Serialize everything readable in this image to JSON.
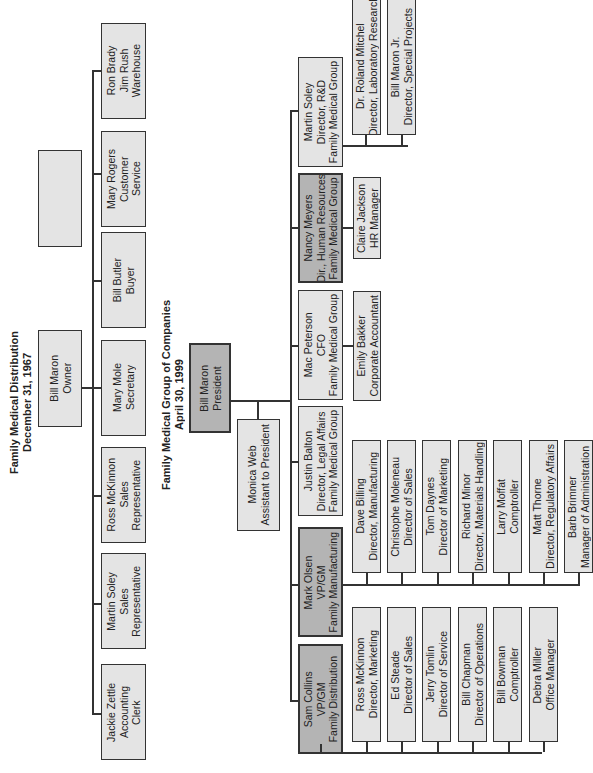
{
  "orientation": "rotated 90° counter-clockwise (text reads bottom-to-top)",
  "chart_1967": {
    "title": "Family Medical Distribution",
    "date": "December 31, 1967",
    "root": {
      "name": "Bill Maron",
      "title": "Owner"
    },
    "reports": [
      {
        "name": "Jackie Zettle",
        "title": "Accounting Clerk"
      },
      {
        "name": "Martin Soley",
        "title": "Sales Representative"
      },
      {
        "name": "Ross McKinnon",
        "title": "Sales Representative"
      },
      {
        "name": "Mary Mole",
        "title": "Secretary"
      },
      {
        "name": "Bill Butler",
        "title": "Buyer"
      },
      {
        "name": "Mary Rogers",
        "title": "Customer Service"
      },
      {
        "name": "Ron Brady / Jim Rush",
        "title": "Warehouse"
      }
    ]
  },
  "chart_1999": {
    "title": "Family Medical Group of Companies",
    "date": "April 30, 1999",
    "root": {
      "name": "Bill Maron",
      "title": "President"
    },
    "assistant": {
      "name": "Monica Web",
      "title": "Assistant to President"
    },
    "reports": [
      {
        "name": "Sam Collins",
        "title": "VP/GM",
        "org": "Family Distribution",
        "reports": [
          {
            "name": "Ross McKinnon",
            "title": "Director, Marketing"
          },
          {
            "name": "Ed Steade",
            "title": "Director of Sales"
          },
          {
            "name": "Jerry Tomlin",
            "title": "Director of Service"
          },
          {
            "name": "Bill Chapman",
            "title": "Director of Operations"
          },
          {
            "name": "Bill Bowman",
            "title": "Comptroller"
          },
          {
            "name": "Debra Miller",
            "title": "Office Manager"
          }
        ]
      },
      {
        "name": "Mark Olsen",
        "title": "VP/GM",
        "org": "Family Manufacturing",
        "reports": [
          {
            "name": "Dave Billing",
            "title": "Director, Manufacturing"
          },
          {
            "name": "Christophe Moleneau",
            "title": "Director of Sales"
          },
          {
            "name": "Tom Daynes",
            "title": "Director of Marketing"
          },
          {
            "name": "Richard Minor",
            "title": "Director, Materials Handling"
          },
          {
            "name": "Larry Moffat",
            "title": "Comptroller"
          },
          {
            "name": "Matt Thorne",
            "title": "Director, Regulatory Affairs"
          },
          {
            "name": "Barb Brimner",
            "title": "Manager of Administration"
          }
        ]
      },
      {
        "name": "Justin Balton",
        "title": "Director, Legal Affairs",
        "org": "Family Medical Group"
      },
      {
        "name": "Mac Peterson",
        "title": "CFO",
        "org": "Family Medical Group",
        "reports": [
          {
            "name": "Emily Bakker",
            "title": "Corporate Accountant"
          }
        ]
      },
      {
        "name": "Nancy Meyers",
        "title": "Dir., Human Resources",
        "org": "Family Medical Group",
        "reports": [
          {
            "name": "Claire Jackson",
            "title": "HR Manager"
          }
        ]
      },
      {
        "name": "Martin Soley",
        "title": "Director, R&D",
        "org": "Family Medical Group",
        "reports": [
          {
            "name": "Dr. Roland Mitchel",
            "title": "Director, Laboratory Research"
          },
          {
            "name": "Bill Maron Jr.",
            "title": "Director, Special Projects"
          }
        ]
      }
    ]
  },
  "labels": {
    "t1": "Family Medical Distribution\nDecember 31, 1967",
    "t2": "Family Medical Group of Companies\nApril 30, 1999",
    "owner": "Bill Maron\nOwner",
    "ron": "Ron Brady\nJim Rush\nWarehouse",
    "mrogers": "Mary Rogers\nCustomer\nService",
    "butler": "Bill Butler\nBuyer",
    "mole": "Mary Mole\nSecretary",
    "ross67": "Ross McKinnon\nSales\nRepresentative",
    "soley67": "Martin Soley\nSales\nRepresentative",
    "zettle": "Jackie Zettle\nAccounting\nClerk",
    "president": "Bill Maron\nPresident",
    "monica": "Monica Web\nAssistant to President",
    "soleyrd": "Martin Soley\nDirector, R&D\nFamily Medical Group",
    "nancy": "Nancy Meyers\nDir., Human Resources\nFamily Medical Group",
    "mac": "Mac Peterson\nCFO\nFamily Medical Group",
    "justin": "Justin Balton\nDirector, Legal Affairs\nFamily Medical Group",
    "mark": "Mark Olsen\nVP/GM\nFamily Manufacturing",
    "sam": "Sam Collins\nVP/GM\nFamily Distribution",
    "roland": "Dr. Roland Mitchel\nDirector, Laboratory Research",
    "jr": "Bill Maron Jr.\nDirector, Special Projects",
    "claire": "Claire Jackson\nHR Manager",
    "emily": "Emily Bakker\nCorporate Accountant",
    "dave": "Dave Billing\nDirector, Manufacturing",
    "chris": "Christophe Moleneau\nDirector of Sales",
    "tom": "Tom Daynes\nDirector of Marketing",
    "richard": "Richard Minor\nDirector, Materials Handling",
    "larry": "Larry Moffat\nComptroller",
    "matt": "Matt Thorne\nDirector, Regulatory Affairs",
    "barb": "Barb Brimner\nManager of Administration",
    "ross99": "Ross McKinnon\nDirector, Marketing",
    "ed": "Ed Steade\nDirector of Sales",
    "jerry": "Jerry Tomlin\nDirector of Service",
    "chapman": "Bill Chapman\nDirector of Operations",
    "bowman": "Bill Bowman\nComptroller",
    "debra": "Debra Miller\nOffice Manager"
  },
  "colors": {
    "light_box": "#e4e4e4",
    "dark_box": "#b4b4b4",
    "line": "#333333"
  }
}
